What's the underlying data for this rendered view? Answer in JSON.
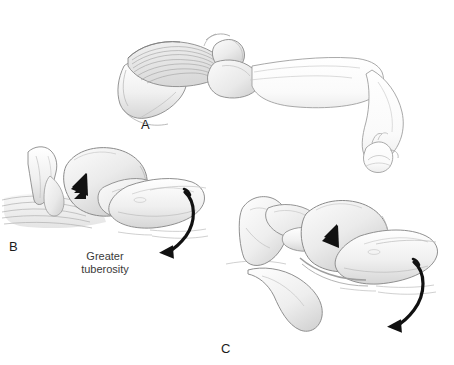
{
  "figure": {
    "width": 454,
    "height": 365,
    "background_color": "#ffffff",
    "style": "grayscale medical line illustration"
  },
  "colors": {
    "outline": "#8a8a8a",
    "outline_dark": "#6e6e6e",
    "bone_fill_light": "#f4f4f4",
    "bone_fill_mid": "#e4e4e4",
    "bone_fill_shadow": "#cfcfcf",
    "muscle_stripe": "#9a9a9a",
    "arrow_black": "#111111",
    "label_text": "#1b1b1b",
    "anno_text": "#3a3a3a"
  },
  "panels": [
    {
      "id": "a",
      "label": "A",
      "label_position": {
        "x": 141,
        "y": 118
      },
      "description": "Lateral view of shoulder and extended arm with hand gripping weight",
      "parts": [
        {
          "name": "deltoid-muscle",
          "description": "striated muscle belly over shoulder"
        },
        {
          "name": "humerus-head",
          "description": "rounded proximal humerus"
        },
        {
          "name": "upper-arm",
          "description": "arm outline extending to the right"
        },
        {
          "name": "forearm",
          "description": "forearm angling down to the right"
        },
        {
          "name": "hand-fist",
          "description": "closed hand grasping at distal end"
        }
      ],
      "arrows": []
    },
    {
      "id": "b",
      "label": "B",
      "label_position": {
        "x": 9,
        "y": 240
      },
      "description": "Close-up of glenohumeral joint before reduction, with greater tuberosity annotated",
      "parts": [
        {
          "name": "acromion",
          "description": "overhanging acromial process at left"
        },
        {
          "name": "glenoid",
          "description": "glenoid fossa"
        },
        {
          "name": "humeral-head",
          "description": "large rounded humeral head"
        },
        {
          "name": "greater-tuberosity",
          "description": "bony prominence lateral to head"
        },
        {
          "name": "humeral-shaft",
          "description": "shaft continuing to the right"
        },
        {
          "name": "soft-tissue-striations",
          "description": "layered tissue lines below joint"
        }
      ],
      "arrows": [
        {
          "name": "pressure-arrow",
          "type": "straight-solid",
          "direction": "down-left",
          "x": 62,
          "y": 180
        },
        {
          "name": "rotation-arrow",
          "type": "curved",
          "direction": "clockwise-downward",
          "x": 180,
          "y": 190
        }
      ],
      "annotations": [
        {
          "name": "greater-tuberosity-label",
          "text": "Greater\ntuberosity",
          "line1": "Greater",
          "line2": "tuberosity",
          "x": 105,
          "y": 256
        }
      ]
    },
    {
      "id": "c",
      "label": "C",
      "label_position": {
        "x": 221,
        "y": 342
      },
      "description": "Close-up of glenohumeral joint after reduction showing scapula, coracoid and acromion",
      "parts": [
        {
          "name": "scapula",
          "description": "scapular body at left"
        },
        {
          "name": "coracoid-process",
          "description": "hook-shaped process projecting forward"
        },
        {
          "name": "acromion",
          "description": "acromial process above joint"
        },
        {
          "name": "humeral-head",
          "description": "relocated humeral head"
        },
        {
          "name": "humeral-shaft",
          "description": "shaft extending to the right"
        },
        {
          "name": "scapular-blade",
          "description": "lower curved scapular margin"
        }
      ],
      "arrows": [
        {
          "name": "pressure-arrow",
          "type": "straight-solid",
          "direction": "down-left",
          "x": 313,
          "y": 232
        },
        {
          "name": "rotation-arrow",
          "type": "curved",
          "direction": "clockwise-downward",
          "x": 412,
          "y": 262
        }
      ],
      "annotations": []
    }
  ],
  "annotations": {
    "greater_tuberosity_line1": "Greater",
    "greater_tuberosity_line2": "tuberosity"
  },
  "labels": {
    "a": "A",
    "b": "B",
    "c": "C"
  }
}
